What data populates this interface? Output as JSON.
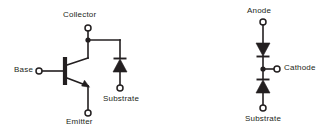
{
  "figure": {
    "background_color": "#ffffff",
    "ink_color": "#231f20",
    "type": "schematic-diagram"
  },
  "left_circuit": {
    "name": "npn-transistor-with-substrate-diode",
    "labels": {
      "collector": "Collector",
      "base": "Base",
      "emitter": "Emitter",
      "substrate": "Substrate"
    },
    "components": [
      {
        "symbol": "npn-transistor",
        "terminals": [
          "Collector",
          "Base",
          "Emitter"
        ]
      },
      {
        "symbol": "diode",
        "orientation": "cathode-up",
        "terminals": [
          "Collector",
          "Substrate"
        ]
      }
    ]
  },
  "right_circuit": {
    "name": "back-to-back-diode-pair",
    "labels": {
      "anode": "Anode",
      "cathode": "Cathode",
      "substrate": "Substrate"
    },
    "components": [
      {
        "symbol": "diode",
        "orientation": "cathode-down",
        "terminals": [
          "Anode",
          "Cathode"
        ]
      },
      {
        "symbol": "diode",
        "orientation": "cathode-up",
        "terminals": [
          "Substrate",
          "Cathode"
        ]
      }
    ]
  }
}
